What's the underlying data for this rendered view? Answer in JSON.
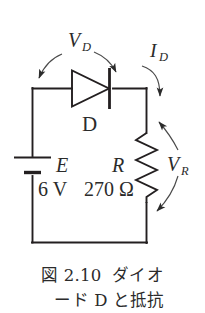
{
  "figure": {
    "title_number": "2.10",
    "caption_line_1": "図 2.10  ダイオ",
    "caption_line_2": "ード D と抵抗",
    "caption_full": "図 2.10 ダイオード D と抵抗",
    "background_color": "#ffffff",
    "ink_color": "#231f20"
  },
  "circuit": {
    "type": "series-diode-resistor-loop",
    "labels": {
      "diode_voltage": "V",
      "diode_voltage_sub": "D",
      "diode_current": "I",
      "diode_current_sub": "D",
      "diode_name": "D",
      "source_name": "E",
      "source_value": "6 V",
      "resistor_name": "R",
      "resistor_value": "270 Ω",
      "resistor_voltage": "V",
      "resistor_voltage_sub": "R"
    },
    "components": [
      {
        "id": "battery",
        "name": "E",
        "value": "6 V",
        "symbol": "dc-source",
        "position": "left-branch"
      },
      {
        "id": "diode",
        "name": "D",
        "value": "",
        "symbol": "diode",
        "position": "top-branch",
        "orientation": "anode-left-cathode-right"
      },
      {
        "id": "resistor",
        "name": "R",
        "value": "270 Ω",
        "symbol": "zigzag-resistor",
        "position": "right-branch"
      }
    ],
    "annotations": [
      {
        "id": "vd",
        "label": "V_D",
        "target": "diode",
        "arrow_style": "double-curved-down"
      },
      {
        "id": "id",
        "label": "I_D",
        "target": "top-right-wire",
        "arrow_style": "curved-down"
      },
      {
        "id": "vr",
        "label": "V_R",
        "target": "resistor",
        "arrow_style": "double-curved-left"
      }
    ]
  }
}
